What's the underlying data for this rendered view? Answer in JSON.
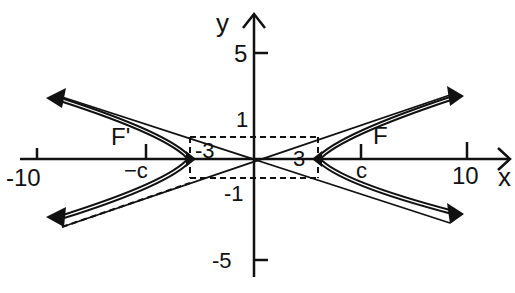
{
  "figure": {
    "axes": {
      "x_label": "x",
      "y_label": "y",
      "x_ticks": [
        {
          "value": -10,
          "label": "-10"
        },
        {
          "value": -5.1,
          "label": "−c"
        },
        {
          "value": 5.1,
          "label": "c"
        },
        {
          "value": 10,
          "label": "10"
        }
      ],
      "y_ticks": [
        {
          "value": 5,
          "label": "5"
        },
        {
          "value": 1,
          "label": "1"
        },
        {
          "value": -1,
          "label": "-1"
        },
        {
          "value": -5,
          "label": "-5"
        }
      ]
    },
    "vertices": [
      {
        "label": "-3",
        "x": -3,
        "y": 0
      },
      {
        "label": "3",
        "x": 3,
        "y": 0
      }
    ],
    "foci": [
      {
        "label": "F'",
        "x_label": "−c"
      },
      {
        "label": "F",
        "x_label": "c"
      }
    ],
    "rectangle": {
      "x_min": -3,
      "x_max": 3,
      "y_min": -1,
      "y_max": 1,
      "style": "dashed"
    },
    "colors": {
      "ink": "#111111",
      "background": "#ffffff"
    }
  }
}
